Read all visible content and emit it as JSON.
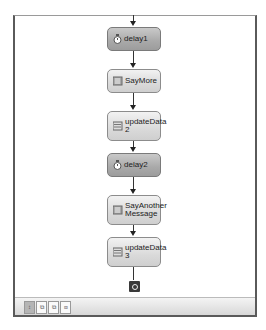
{
  "workflow": {
    "nodes": [
      {
        "id": "delay1",
        "label": "delay1",
        "type": "delay",
        "icon": "clock-icon"
      },
      {
        "id": "SayMore",
        "label": "SayMore",
        "type": "code",
        "icon": "code-activity-icon"
      },
      {
        "id": "updateData2",
        "label": "updateData 2",
        "type": "data",
        "icon": "data-update-icon"
      },
      {
        "id": "delay2",
        "label": "delay2",
        "type": "delay",
        "icon": "clock-icon"
      },
      {
        "id": "SayAnotherMessage",
        "label": "SayAnother Message",
        "type": "code",
        "icon": "code-activity-icon"
      },
      {
        "id": "updateData3",
        "label": "updateData 3",
        "type": "data",
        "icon": "data-update-icon"
      }
    ],
    "end_marker": "workflow-end-icon"
  },
  "toolbar": {
    "views": [
      {
        "name": "workflow-view",
        "icon": "sequence-icon",
        "glyph": "↕",
        "active": true
      },
      {
        "name": "cancel-handler-view",
        "icon": "cancel-handler-icon",
        "glyph": "⧉",
        "active": false
      },
      {
        "name": "fault-handler-view",
        "icon": "fault-handler-icon",
        "glyph": "⧉",
        "active": false
      },
      {
        "name": "event-handler-view",
        "icon": "event-handler-icon",
        "glyph": "⧈",
        "active": false
      }
    ]
  },
  "colors": {
    "delay_node": "#a9a9a9",
    "activity_node": "#dadada",
    "connector": "#333333"
  }
}
